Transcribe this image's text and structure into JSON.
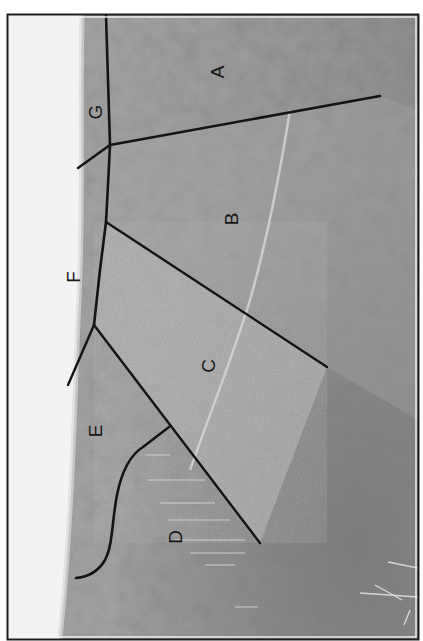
{
  "figure": {
    "orientation": "rotated 90 degrees",
    "colors": {
      "sky": "#f2f2f2",
      "forest_dark": "#7a7a7a",
      "forest_mid": "#9a9a9a",
      "clearing_light": "#bdbdbd",
      "lines": "#141414",
      "border": "#1e1e1e"
    },
    "regions": [
      {
        "id": "A",
        "label": "A"
      },
      {
        "id": "B",
        "label": "B"
      },
      {
        "id": "C",
        "label": "C"
      },
      {
        "id": "D",
        "label": "D"
      },
      {
        "id": "E",
        "label": "E"
      },
      {
        "id": "F",
        "label": "F"
      },
      {
        "id": "G",
        "label": "G"
      }
    ]
  }
}
